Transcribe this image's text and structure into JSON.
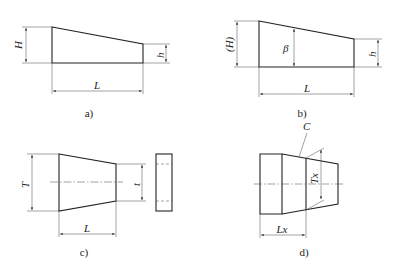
{
  "figures": [
    {
      "id": "a",
      "caption": "a)",
      "labels": {
        "height_left": "H",
        "height_right": "h",
        "length": "L"
      }
    },
    {
      "id": "b",
      "caption": "b)",
      "labels": {
        "height_left": "(H)",
        "slope": "β",
        "height_right": "h",
        "length": "L"
      }
    },
    {
      "id": "c",
      "caption": "c)",
      "labels": {
        "width_left": "T",
        "width_right": "t",
        "length": "L"
      }
    },
    {
      "id": "d",
      "caption": "d)",
      "labels": {
        "chamfer": "C",
        "width": "Tx",
        "length": "Lx"
      }
    }
  ]
}
